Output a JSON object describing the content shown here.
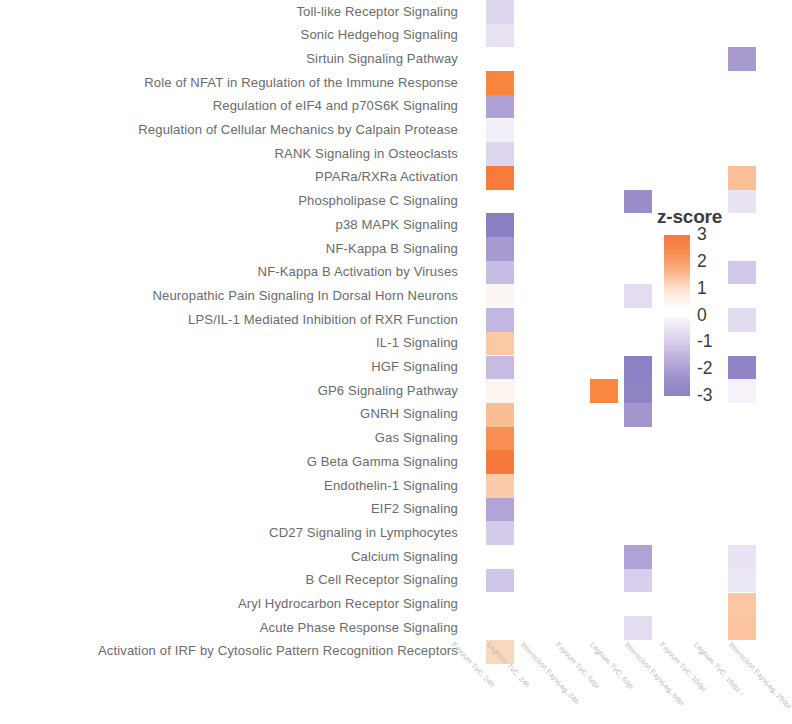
{
  "legend": {
    "title": "z-score",
    "ticks": [
      "3",
      "2",
      "1",
      "0",
      "-1",
      "-2",
      "-3"
    ],
    "max": 3,
    "min": -3,
    "color_positive": "#F4793B",
    "color_zero": "#FFFFFF",
    "color_negative": "#8B82C2"
  },
  "chart_data": {
    "type": "heatmap",
    "title": "",
    "xlabel": "",
    "ylabel": "",
    "legend_title": "z-score",
    "legend_position": "right",
    "grid": false,
    "zlim": [
      -3,
      3
    ],
    "colorscale": [
      {
        "z": 3,
        "hex": "#F4793B"
      },
      {
        "z": 2,
        "hex": "#F89759"
      },
      {
        "z": 1,
        "hex": "#FBC9A8"
      },
      {
        "z": 0,
        "hex": "#FFFFFF"
      },
      {
        "z": -1,
        "hex": "#D9CFEC"
      },
      {
        "z": -2,
        "hex": "#B0A2D6"
      },
      {
        "z": -3,
        "hex": "#8B82C2"
      }
    ],
    "columns": [
      "Fayoum TvC, 24h",
      "Leghorn TvC, 24h",
      "Interaction FayvLeg, 24h",
      "Fayoum TvC, 6dpi",
      "Leghorn TvC, 6dpi",
      "Interaction FayvLeg, 6dpi",
      "Fayoum TvC, 10dpi",
      "Leghorn TvC, 10dpi",
      "Interaction FayvLeg, 10dpi"
    ],
    "rows": [
      "Toll-like Receptor Signaling",
      "Sonic Hedgehog Signaling",
      "Sirtuin Signaling Pathway",
      "Role of NFAT in Regulation of the Immune Response",
      "Regulation of eIF4 and p70S6K Signaling",
      "Regulation of Cellular Mechanics by Calpain Protease",
      "RANK Signaling in Osteoclasts",
      "PPARa/RXRa Activation",
      "Phospholipase C Signaling",
      "p38 MAPK Signaling",
      "NF-Kappa B Signaling",
      "NF-Kappa B Activation by Viruses",
      "Neuropathic Pain Signaling In Dorsal Horn Neurons",
      "LPS/IL-1 Mediated Inhibition of RXR Function",
      "IL-1 Signaling",
      "HGF Signaling",
      "GP6 Signaling Pathway",
      "GNRH Signaling",
      "Gas Signaling",
      "G Beta Gamma Signaling",
      "Endothelin-1 Signaling",
      "EIF2 Signaling",
      "CD27 Signaling in Lymphocytes",
      "Calcium Signaling",
      "B Cell Receptor Signaling",
      "Aryl Hydrocarbon Receptor Signaling",
      "Acute Phase Response Signaling",
      "Activation of IRF by Cytosolic Pattern Recognition Receptors"
    ],
    "values": [
      [
        -0.9,
        null,
        null,
        null,
        null,
        null,
        null,
        null,
        null
      ],
      [
        -0.6,
        null,
        null,
        null,
        null,
        null,
        null,
        null,
        null
      ],
      [
        null,
        null,
        null,
        null,
        null,
        null,
        null,
        -1.6,
        null
      ],
      [
        2.6,
        null,
        null,
        null,
        null,
        null,
        null,
        null,
        null
      ],
      [
        -1.7,
        null,
        null,
        null,
        null,
        null,
        null,
        null,
        null
      ],
      [
        -0.4,
        null,
        null,
        null,
        null,
        null,
        null,
        null,
        null
      ],
      [
        -0.9,
        null,
        null,
        null,
        null,
        null,
        null,
        null,
        null
      ],
      [
        2.7,
        null,
        null,
        null,
        null,
        null,
        null,
        1.4,
        null
      ],
      [
        null,
        null,
        null,
        null,
        -2.2,
        null,
        null,
        -0.5,
        null
      ],
      [
        -2.3,
        null,
        null,
        null,
        null,
        null,
        null,
        null,
        null
      ],
      [
        -1.8,
        null,
        null,
        null,
        null,
        null,
        null,
        null,
        null
      ],
      [
        -1.2,
        null,
        null,
        null,
        null,
        null,
        null,
        -1.1,
        null
      ],
      [
        -0.2,
        null,
        null,
        null,
        -0.6,
        null,
        null,
        null,
        null
      ],
      [
        -1.3,
        null,
        null,
        null,
        null,
        null,
        null,
        -0.7,
        null
      ],
      [
        1.3,
        null,
        null,
        null,
        null,
        null,
        null,
        null,
        null
      ],
      [
        -1.2,
        null,
        null,
        null,
        -2.4,
        null,
        null,
        -2.1,
        null
      ],
      [
        -0.2,
        null,
        null,
        2.3,
        -2.4,
        null,
        null,
        -0.3,
        null
      ],
      [
        1.5,
        null,
        null,
        null,
        -1.8,
        null,
        null,
        null,
        null
      ],
      [
        2.3,
        null,
        null,
        null,
        null,
        null,
        null,
        null,
        null
      ],
      [
        2.8,
        null,
        null,
        null,
        null,
        null,
        null,
        null,
        null
      ],
      [
        1.1,
        null,
        null,
        null,
        null,
        null,
        null,
        null,
        null
      ],
      [
        -1.7,
        null,
        null,
        null,
        null,
        null,
        null,
        null,
        null
      ],
      [
        -1.0,
        null,
        null,
        null,
        null,
        null,
        null,
        null,
        null
      ],
      [
        null,
        null,
        null,
        null,
        -1.6,
        null,
        null,
        -0.6,
        null
      ],
      [
        -1.2,
        null,
        null,
        null,
        -0.9,
        null,
        null,
        -0.4,
        null
      ],
      [
        null,
        null,
        null,
        null,
        null,
        null,
        null,
        1.2,
        null
      ],
      [
        null,
        null,
        null,
        null,
        -0.8,
        null,
        null,
        1.3,
        null
      ],
      [
        0.9,
        null,
        null,
        null,
        null,
        null,
        null,
        null,
        null
      ]
    ],
    "cell_colors": [
      [
        "#DFD7EF",
        null,
        null,
        null,
        null,
        null,
        null,
        null,
        null
      ],
      [
        "#E8E2F3",
        null,
        null,
        null,
        null,
        null,
        null,
        null,
        null
      ],
      [
        null,
        null,
        null,
        null,
        null,
        null,
        null,
        "#A99BD0",
        null
      ],
      [
        "#F7853F",
        null,
        null,
        null,
        null,
        null,
        null,
        null,
        null
      ],
      [
        "#AFA1D5",
        null,
        null,
        null,
        null,
        null,
        null,
        null,
        null
      ],
      [
        "#F3EFF9",
        null,
        null,
        null,
        null,
        null,
        null,
        null,
        null
      ],
      [
        "#DED6EE",
        null,
        null,
        null,
        null,
        null,
        null,
        null,
        null
      ],
      [
        "#F87B3A",
        null,
        null,
        null,
        null,
        null,
        null,
        "#FBBE96",
        null
      ],
      [
        null,
        null,
        null,
        null,
        "#9B8CCA",
        null,
        null,
        "#E9E3F4",
        null
      ],
      [
        "#8B7FC2",
        null,
        null,
        null,
        null,
        null,
        null,
        null,
        null
      ],
      [
        "#A89AD0",
        null,
        null,
        null,
        null,
        null,
        null,
        null,
        null
      ],
      [
        "#C8BDE4",
        null,
        null,
        null,
        null,
        null,
        null,
        "#D2C8E9",
        null
      ],
      [
        "#FCF6F2",
        null,
        null,
        null,
        "#E4DDF1",
        null,
        null,
        null,
        null
      ],
      [
        "#C2B7E0",
        null,
        null,
        null,
        null,
        null,
        null,
        "#E3DCF1",
        null
      ],
      [
        "#FAC9A5",
        null,
        null,
        null,
        null,
        null,
        null,
        null,
        null
      ],
      [
        "#C6BBE3",
        null,
        null,
        null,
        "#8D80C4",
        null,
        null,
        "#9184C6",
        null
      ],
      [
        "#FBF4EF",
        null,
        null,
        "#F8873F",
        "#9083C5",
        null,
        null,
        "#F7F2FA",
        null
      ],
      [
        "#F9BE93",
        null,
        null,
        null,
        "#A396CC",
        null,
        null,
        null,
        null
      ],
      [
        "#F98F52",
        null,
        null,
        null,
        null,
        null,
        null,
        null,
        null
      ],
      [
        "#F7793B",
        null,
        null,
        null,
        null,
        null,
        null,
        null,
        null
      ],
      [
        "#FBCCAB",
        null,
        null,
        null,
        null,
        null,
        null,
        null,
        null
      ],
      [
        "#B2A4D7",
        null,
        null,
        null,
        null,
        null,
        null,
        null,
        null
      ],
      [
        "#D4CBEA",
        null,
        null,
        null,
        null,
        null,
        null,
        null,
        null
      ],
      [
        null,
        null,
        null,
        null,
        "#B0A2D6",
        null,
        null,
        "#E9E3F4",
        null
      ],
      [
        "#CFC5E8",
        null,
        null,
        null,
        "#D8CFEC",
        null,
        null,
        "#EDE8F6",
        null
      ],
      [
        null,
        null,
        null,
        null,
        null,
        null,
        null,
        "#FBC7A2",
        null
      ],
      [
        null,
        null,
        null,
        null,
        "#E4DDF1",
        null,
        null,
        "#FBC49E",
        null
      ],
      [
        "#FBD7BC",
        null,
        null,
        null,
        null,
        null,
        null,
        null,
        null
      ]
    ]
  }
}
